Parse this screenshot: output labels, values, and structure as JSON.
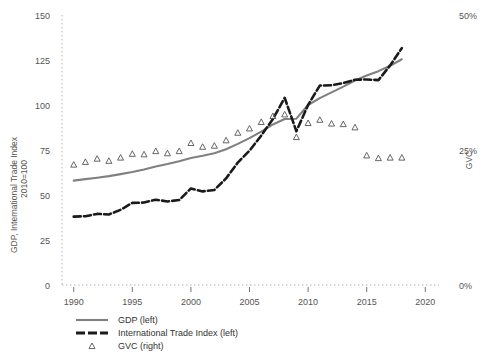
{
  "chart_data": {
    "type": "line",
    "title": "",
    "xlabel": "",
    "ylabel": "GDP, International Trade Index",
    "ylabel_line2": "2010=100",
    "y2label": "GVC",
    "xlim": [
      1989,
      2021
    ],
    "ylim": [
      0,
      150
    ],
    "y2lim": [
      0,
      50
    ],
    "grid": false,
    "legend_position": "bottom-left",
    "xticks": [
      "1990",
      "1995",
      "2000",
      "2005",
      "2010",
      "2015",
      "2020"
    ],
    "xtick_values": [
      1990,
      1995,
      2000,
      2005,
      2010,
      2015,
      2020
    ],
    "yticks": [
      "0",
      "25",
      "50",
      "75",
      "100",
      "125",
      "150"
    ],
    "ytick_values": [
      0,
      25,
      50,
      75,
      100,
      125,
      150
    ],
    "y2ticks": [
      "0%",
      "25%",
      "50%"
    ],
    "y2tick_values": [
      0,
      25,
      50
    ],
    "x": [
      1990,
      1991,
      1992,
      1993,
      1994,
      1995,
      1996,
      1997,
      1998,
      1999,
      2000,
      2001,
      2002,
      2003,
      2004,
      2005,
      2006,
      2007,
      2008,
      2009,
      2010,
      2011,
      2012,
      2013,
      2014,
      2015,
      2016,
      2017,
      2018
    ],
    "series": [
      {
        "name": "GDP (left)",
        "axis": "left",
        "style": "solid",
        "color": "#808080",
        "values": [
          58.0,
          58.8,
          59.6,
          60.5,
          61.6,
          62.8,
          64.2,
          65.8,
          67.2,
          68.8,
          70.6,
          71.8,
          73.2,
          75.4,
          78.4,
          81.6,
          85.2,
          89.2,
          92.2,
          92.4,
          100.0,
          103.8,
          107.0,
          110.2,
          113.6,
          116.4,
          118.8,
          121.8,
          125.4
        ]
      },
      {
        "name": "International Trade Index (left)",
        "axis": "left",
        "style": "dashed",
        "color": "#1a1a1a",
        "values": [
          38.0,
          38.2,
          39.5,
          39.2,
          41.8,
          45.6,
          45.8,
          47.4,
          46.4,
          47.2,
          53.6,
          52.0,
          52.8,
          59.2,
          68.0,
          74.6,
          83.0,
          92.2,
          104.0,
          85.4,
          100.0,
          110.8,
          111.0,
          112.2,
          114.0,
          114.2,
          113.8,
          122.0,
          131.6
        ]
      },
      {
        "name": "GVC (right)",
        "axis": "right",
        "style": "marker",
        "marker": "triangle-open",
        "color": "#555555",
        "values": [
          22.3,
          22.8,
          23.4,
          23.0,
          23.6,
          24.3,
          24.2,
          24.8,
          24.4,
          24.8,
          26.3,
          25.6,
          25.8,
          26.8,
          28.2,
          29.0,
          30.2,
          31.3,
          31.6,
          27.4,
          30.0,
          30.6,
          29.9,
          29.8,
          29.2,
          24.0,
          23.5,
          23.6,
          23.6
        ]
      }
    ]
  },
  "legend": {
    "entries": [
      {
        "label": "GDP (left)",
        "swatch": "solid-gray-line"
      },
      {
        "label": "International Trade Index (left)",
        "swatch": "dashed-black-line"
      },
      {
        "label": "GVC (right)",
        "swatch": "open-triangle-marker"
      }
    ]
  },
  "colors": {
    "gdp_line": "#808080",
    "trade_line": "#1a1a1a",
    "gvc_marker": "#555555",
    "axis": "#555555",
    "text": "#444444",
    "background": "#ffffff"
  }
}
